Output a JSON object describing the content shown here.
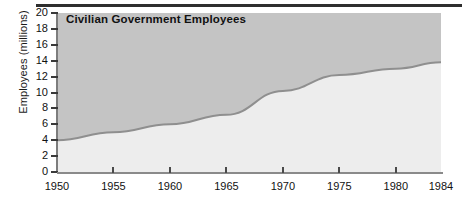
{
  "chart_data": {
    "type": "area",
    "title": "Civilian Government Employees",
    "xlabel": "",
    "ylabel": "Employees (millions)",
    "x": [
      1950,
      1955,
      1960,
      1965,
      1970,
      1975,
      1980,
      1984
    ],
    "values": [
      4.0,
      5.0,
      6.0,
      7.2,
      10.2,
      12.2,
      13.0,
      13.8
    ],
    "series": [
      {
        "name": "Civilian Government Employees",
        "values": [
          4.0,
          5.0,
          6.0,
          7.2,
          10.2,
          12.2,
          13.0,
          13.8
        ]
      }
    ],
    "xlim": [
      1950,
      1984
    ],
    "ylim": [
      0,
      20
    ],
    "xticks": [
      1950,
      1955,
      1960,
      1965,
      1970,
      1975,
      1980,
      1984
    ],
    "xtick_labels": [
      "1950",
      "1955",
      "1960",
      "1965",
      "1970",
      "1975",
      "1980",
      "1984"
    ],
    "yticks": [
      0,
      2,
      4,
      6,
      8,
      10,
      12,
      14,
      16,
      18,
      20
    ],
    "ytick_labels": [
      "0",
      "2",
      "4",
      "6",
      "8",
      "10",
      "12",
      "14",
      "16",
      "18",
      "20"
    ],
    "grid": false,
    "legend": "none",
    "colors": {
      "area_above": "#c4c4c4",
      "area_below": "#ededed",
      "curve": "#8f8f8f",
      "axis": "#3a3a3a",
      "text": "#111111",
      "top_rule": "#2e2e2e"
    }
  }
}
